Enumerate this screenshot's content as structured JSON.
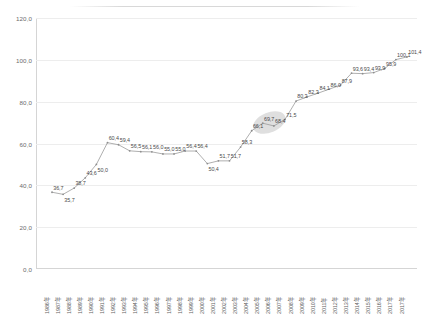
{
  "chart_data": {
    "type": "line",
    "title": "",
    "subtitle": "",
    "xlabel": "",
    "ylabel": "",
    "ylim": [
      0.0,
      120.0
    ],
    "yticks": [
      "0,0",
      "20,0",
      "40,0",
      "60,0",
      "80,0",
      "100,0",
      "120,0"
    ],
    "ytick_values": [
      0,
      20,
      40,
      60,
      80,
      100,
      120
    ],
    "grid": true,
    "legend": "none",
    "categories": [
      "1986年",
      "1987年",
      "1988年",
      "1989年",
      "1990年",
      "1991年",
      "1992年",
      "1993年",
      "1994年",
      "1995年",
      "1996年",
      "1997年",
      "1998年",
      "1999年",
      "2000年",
      "2001年",
      "2002年",
      "2003年",
      "2004年",
      "2005年",
      "2006年",
      "2007年",
      "2008年",
      "2009年",
      "2010年",
      "2011年",
      "2012年",
      "2013年",
      "2014年",
      "2015年",
      "2016年",
      "2017年"
    ],
    "values": [
      36.7,
      35.7,
      38.7,
      43.6,
      50.0,
      60.4,
      59.4,
      56.5,
      56.1,
      56.0,
      55.0,
      55.0,
      56.4,
      56.4,
      50.4,
      51.7,
      51.7,
      58.3,
      66.1,
      69.7,
      68.4,
      71.5,
      80.3,
      82.3,
      84.1,
      86.0,
      87.9,
      93.6,
      93.4,
      93.9,
      95.9,
      100.1
    ],
    "labels": [
      "36,7",
      "35,7",
      "38,7",
      "43,6",
      "50,0",
      "60,4",
      "59,4",
      "56,5",
      "56,1",
      "56,0",
      "55,0",
      "55,0",
      "56,4",
      "56,4",
      "50,4",
      "51,7",
      "51,7",
      "58,3",
      "66,1",
      "69,7",
      "68,4",
      "71,5",
      "80,3",
      "82,3",
      "84,1",
      "86,0",
      "87,9",
      "93,6",
      "93,4",
      "93,9",
      "95,9",
      "100,1"
    ],
    "last_point": {
      "label": "101,4",
      "value": 101.4,
      "category": "2017年"
    },
    "annotations": [
      {
        "name": "highlight-ellipse",
        "covers": [
          "69,7",
          "68,4"
        ],
        "color": "#d9d9d9"
      }
    ],
    "colors": {
      "line": "#9a9a9a",
      "marker": "#8e8e8e",
      "grid": "#ededed",
      "axis": "#d5d5d5",
      "highlight": "#d9d9d9"
    }
  }
}
